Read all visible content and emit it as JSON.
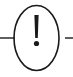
{
  "canvas": {
    "width": 73,
    "height": 77,
    "background_color": "#ffffff",
    "title": "Warning / alert symbol"
  },
  "graphic": {
    "type": "warning-alert-icon",
    "description": "Exclamation mark inside a circular outline with horizontal connector lines on left and right",
    "stroke_color": "#1a1a1a",
    "fill_color": "#1a1a1a",
    "circle": {
      "name": "circle-outline",
      "center_x": 36.5,
      "center_y": 38,
      "radius_x": 22.5,
      "radius_y": 32.5,
      "stroke_width": 1.6,
      "fill": "none"
    },
    "exclamation_stem": {
      "name": "exclamation-stem",
      "top_y": 15,
      "bottom_y": 38,
      "center_x": 36.5,
      "top_width": 4.2,
      "bottom_width": 2.6
    },
    "exclamation_dot": {
      "name": "exclamation-dot",
      "center_x": 36.5,
      "center_y": 43.5,
      "radius": 2.6
    },
    "connector_left": {
      "name": "connector-line-left",
      "x1": 0,
      "y1": 38,
      "x2": 15,
      "y2": 38,
      "stroke_width": 1.4
    },
    "connector_right": {
      "name": "connector-line-right",
      "x1": 65,
      "y1": 38,
      "x2": 73,
      "y2": 38,
      "stroke_width": 1.4
    }
  }
}
